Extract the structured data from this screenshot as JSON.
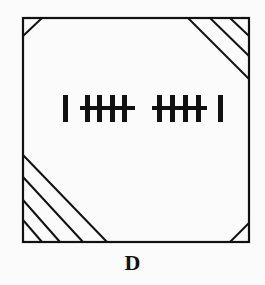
{
  "figure": {
    "option_label": "D",
    "stroke_color": "#111111",
    "background": "#fbfbfb",
    "box": {
      "x": 23,
      "y": 18,
      "width": 226,
      "height": 224
    },
    "corners": {
      "top_left": {
        "hatch_lines": 1
      },
      "top_right": {
        "hatch_lines": 3
      },
      "bottom_left": {
        "hatch_lines": 4
      },
      "bottom_right": {
        "hatch_lines": 1
      }
    },
    "tally": {
      "left_single_bars": 1,
      "group_1_vertical_bars": 4,
      "group_2_vertical_bars": 4,
      "right_single_bars": 1
    }
  }
}
